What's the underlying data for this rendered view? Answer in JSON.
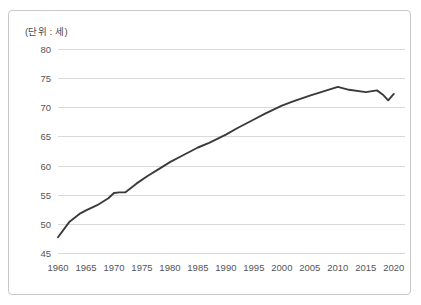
{
  "figure": {
    "unit_label": "(단위 : 세)",
    "border_color": "#c8c8c8",
    "background_color": "#ffffff"
  },
  "chart_data": {
    "type": "line",
    "title": "",
    "subtitle": "",
    "xlabel": "",
    "ylabel": "",
    "unit_note": "(단위 : 세)",
    "xlim": [
      1960,
      2022
    ],
    "ylim": [
      45,
      80
    ],
    "grid": "horizontal",
    "legend": "none",
    "line_color": "#3a3a3a",
    "grid_color": "#d9d9d9",
    "tick_label_color": "#555555",
    "y_ticks": [
      45,
      50,
      55,
      60,
      65,
      70,
      75,
      80
    ],
    "x_ticks": [
      1960,
      1965,
      1970,
      1975,
      1980,
      1985,
      1990,
      1995,
      2000,
      2005,
      2010,
      2015,
      2020
    ],
    "series": [
      {
        "name": "기대수명",
        "x": [
          1960,
          1962,
          1964,
          1965,
          1967,
          1969,
          1970,
          1971,
          1972,
          1974,
          1976,
          1978,
          1980,
          1982,
          1985,
          1987,
          1990,
          1992,
          1995,
          1997,
          2000,
          2002,
          2005,
          2007,
          2010,
          2012,
          2015,
          2017,
          2018,
          2019,
          2020
        ],
        "values": [
          47.7,
          50.3,
          51.8,
          52.3,
          53.2,
          54.4,
          55.3,
          55.4,
          55.4,
          56.9,
          58.2,
          59.4,
          60.6,
          61.6,
          63.1,
          63.9,
          65.3,
          66.4,
          67.9,
          68.9,
          70.3,
          71.0,
          72.0,
          72.6,
          73.5,
          73.0,
          72.6,
          72.9,
          72.2,
          71.2,
          72.3
        ],
        "color": "#3a3a3a"
      }
    ],
    "annotations": []
  }
}
